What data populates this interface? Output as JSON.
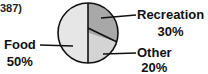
{
  "figure_ref": "387)",
  "chart_data": {
    "type": "pie",
    "title": "",
    "slices": [
      {
        "label": "Recreation",
        "value": 30,
        "value_label": "30%",
        "color": "#a8a8a8"
      },
      {
        "label": "Other",
        "value": 20,
        "value_label": "20%",
        "color": "#d4d4d4"
      },
      {
        "label": "Food",
        "value": 50,
        "value_label": "50%",
        "color": "#e6e6e6"
      }
    ],
    "legend": "none",
    "labels_position": "outside with leader lines"
  }
}
